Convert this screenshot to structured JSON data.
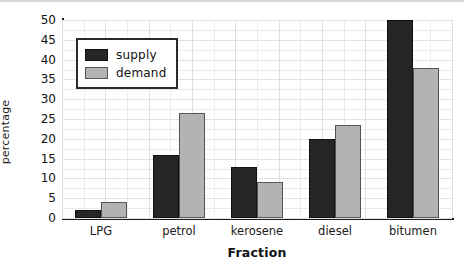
{
  "chart_data": {
    "type": "bar",
    "title": "",
    "xlabel": "Fraction",
    "ylabel": "percentage",
    "categories": [
      "LPG",
      "petrol",
      "kerosene",
      "diesel",
      "bitumen"
    ],
    "series": [
      {
        "name": "supply",
        "color": "#262626",
        "values": [
          2,
          16,
          13,
          20,
          50
        ]
      },
      {
        "name": "demand",
        "color": "#b3b3b3",
        "values": [
          4,
          26.5,
          9,
          23.5,
          38
        ]
      }
    ],
    "ylim": [
      0,
      50
    ],
    "ytick_step": 5,
    "yticks": [
      "50",
      "45",
      "40",
      "35",
      "30",
      "25",
      "20",
      "15",
      "10",
      "5",
      "0"
    ],
    "grid": true,
    "legend_position": "top-left"
  }
}
